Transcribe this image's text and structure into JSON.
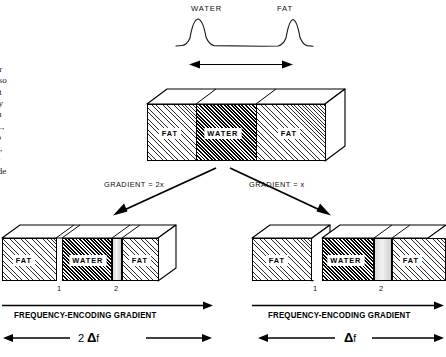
{
  "body_text": {
    "lines": [
      "and water",
      "uencies, so",
      "tive to fat",
      "frequency",
      ". Then, in",
      "e left (i.e.,",
      "d with no",
      "s overlap,",
      "ages. For",
      "alf as wide"
    ]
  },
  "spectrum": {
    "peak_left_label": "WATER",
    "peak_right_label": "FAT",
    "separation_label": "3.5 ppm"
  },
  "top_block": {
    "segments": [
      {
        "label": "FAT",
        "fill": "fat"
      },
      {
        "label": "WATER",
        "fill": "water"
      },
      {
        "label": "FAT",
        "fill": "fat"
      }
    ]
  },
  "branches": {
    "left_label": "GRADIENT = 2x",
    "right_label": "GRADIENT = x"
  },
  "left_result": {
    "segments": [
      {
        "label": "FAT",
        "fill": "fat"
      },
      {
        "label": "WATER",
        "fill": "water"
      },
      {
        "label": "FAT",
        "fill": "fat"
      }
    ],
    "gap_labels": [
      "1",
      "2"
    ],
    "axis_label": "FREQUENCY-ENCODING GRADIENT",
    "delta_prefix": "2",
    "delta_symbol": "Δ",
    "delta_suffix": "f"
  },
  "right_result": {
    "segments": [
      {
        "label": "FAT",
        "fill": "fat"
      },
      {
        "label": "WATER",
        "fill": "water"
      },
      {
        "label": "FAT",
        "fill": "fat"
      }
    ],
    "gap_labels": [
      "1",
      "2"
    ],
    "axis_label": "FREQUENCY-ENCODING GRADIENT",
    "delta_prefix": "",
    "delta_symbol": "Δ",
    "delta_suffix": "f"
  },
  "colors": {
    "ink": "#000000",
    "paper": "#ffffff",
    "gap_fill": "#dcdcdc"
  }
}
